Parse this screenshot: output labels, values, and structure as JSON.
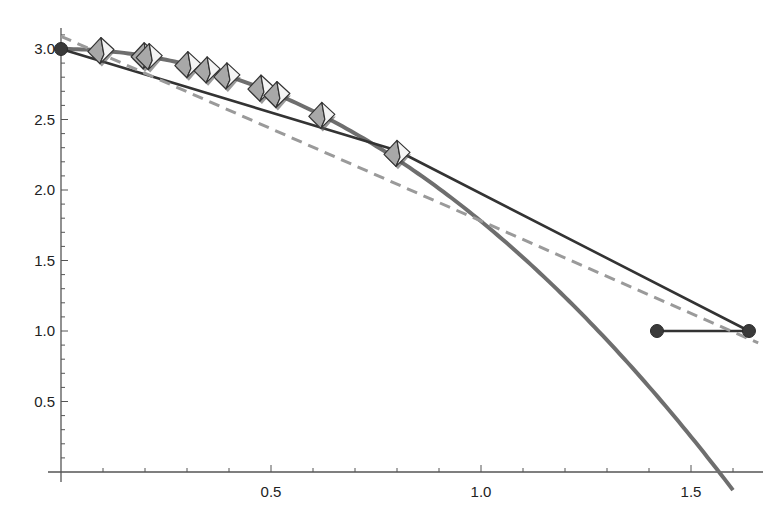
{
  "chart_data": {
    "type": "line",
    "title": "",
    "xlabel": "",
    "ylabel": "",
    "xlim": [
      0,
      1.67
    ],
    "ylim": [
      0,
      3.1
    ],
    "grid": false,
    "legend": null,
    "x_ticks": [
      {
        "value": 0.5,
        "label": "0.5"
      },
      {
        "value": 1.0,
        "label": "1.0"
      },
      {
        "value": 1.5,
        "label": "1.5"
      }
    ],
    "y_ticks": [
      {
        "value": 0.5,
        "label": "0.5"
      },
      {
        "value": 1.0,
        "label": "1.0"
      },
      {
        "value": 1.5,
        "label": "1.5"
      },
      {
        "value": 2.0,
        "label": "2.0"
      },
      {
        "value": 2.5,
        "label": "2.5"
      },
      {
        "value": 3.0,
        "label": "3.0"
      }
    ],
    "series": [
      {
        "name": "curve",
        "style": "thick-solid",
        "color": "#6e6e6e",
        "description": "downward parabola approx y = 3 - 1.222 x^2, crossing x-axis near 1.57",
        "x": [
          0,
          0.1,
          0.2,
          0.3,
          0.4,
          0.5,
          0.6,
          0.7,
          0.8,
          0.9,
          1.0,
          1.1,
          1.2,
          1.3,
          1.4,
          1.5,
          1.57,
          1.6
        ],
        "y": [
          3.0,
          2.988,
          2.951,
          2.89,
          2.804,
          2.695,
          2.56,
          2.401,
          2.218,
          2.01,
          1.778,
          1.521,
          1.24,
          0.935,
          0.605,
          0.25,
          0.0,
          -0.128
        ]
      },
      {
        "name": "polyline",
        "style": "thin-solid",
        "color": "#333333",
        "x": [
          0,
          0.8,
          1.638,
          1.419
        ],
        "y": [
          3.0,
          2.28,
          1.0,
          1.0
        ]
      },
      {
        "name": "fit-line",
        "style": "dashed",
        "color": "#9a9a9a",
        "x": [
          0,
          1.66
        ],
        "y": [
          3.09,
          0.915
        ]
      }
    ],
    "points": [
      {
        "name": "start-point",
        "x": 0,
        "y": 3.0,
        "marker": "circle"
      },
      {
        "name": "end-point-right",
        "x": 1.638,
        "y": 1.0,
        "marker": "circle"
      },
      {
        "name": "end-point-left",
        "x": 1.419,
        "y": 1.0,
        "marker": "circle"
      }
    ],
    "markers": {
      "shape": "octahedron",
      "x": [
        0.095,
        0.198,
        0.21,
        0.302,
        0.348,
        0.395,
        0.476,
        0.514,
        0.621,
        0.8
      ],
      "y": [
        2.989,
        2.952,
        2.946,
        2.889,
        2.852,
        2.809,
        2.723,
        2.677,
        2.529,
        2.26
      ]
    }
  }
}
